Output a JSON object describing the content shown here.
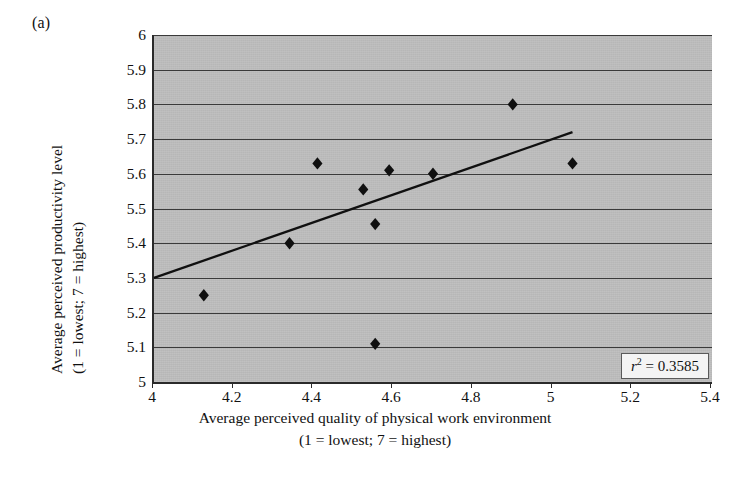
{
  "figure": {
    "panel_label": "(a)"
  },
  "annotation": {
    "r_symbol": "r",
    "r_exponent": "2",
    "r_equals": " = 0.3585",
    "r2_text": "r2 = 0.3585",
    "r2_value": 0.3585
  },
  "axes": {
    "y_title_line1": "Average perceived productivity level",
    "y_title_line2": "(1 = lowest; 7 = highest)",
    "x_title_line1": "Average perceived quality of physical work environment",
    "x_title_line2": "(1 = lowest; 7 = highest)",
    "y_ticks": [
      "5",
      "5.1",
      "5.2",
      "5.3",
      "5.4",
      "5.5",
      "5.6",
      "5.7",
      "5.8",
      "5.9",
      "6"
    ],
    "x_ticks": [
      "4",
      "4.2",
      "4.4",
      "4.6",
      "4.8",
      "5",
      "5.2",
      "5.4"
    ]
  },
  "colors": {
    "plot_background": "#bcbcbc",
    "gridline": "#3a3a3a",
    "axis": "#2a2a2a",
    "marker": "#101010",
    "trendline": "#101010",
    "page_background": "#ffffff"
  },
  "chart_data": {
    "type": "scatter",
    "title": "",
    "xlabel": "Average perceived quality of physical work environment (1 = lowest; 7 = highest)",
    "ylabel": "Average perceived productivity level (1 = lowest; 7 = highest)",
    "xlim": [
      4,
      5.4
    ],
    "ylim": [
      5,
      6
    ],
    "xticks": [
      4,
      4.2,
      4.4,
      4.6,
      4.8,
      5,
      5.2,
      5.4
    ],
    "yticks": [
      5,
      5.1,
      5.2,
      5.3,
      5.4,
      5.5,
      5.6,
      5.7,
      5.8,
      5.9,
      6
    ],
    "grid": "horizontal",
    "legend": "none",
    "marker": "diamond",
    "points": [
      {
        "x": 4.125,
        "y": 5.25
      },
      {
        "x": 4.34,
        "y": 5.4
      },
      {
        "x": 4.41,
        "y": 5.63
      },
      {
        "x": 4.525,
        "y": 5.555
      },
      {
        "x": 4.555,
        "y": 5.455
      },
      {
        "x": 4.555,
        "y": 5.11
      },
      {
        "x": 4.59,
        "y": 5.61
      },
      {
        "x": 4.7,
        "y": 5.6
      },
      {
        "x": 4.9,
        "y": 5.8
      },
      {
        "x": 5.05,
        "y": 5.63
      }
    ],
    "trendline": {
      "x0": 4.0,
      "y0": 5.3,
      "x1": 5.05,
      "y1": 5.72
    },
    "annotations": [
      {
        "text": "r2 = 0.3585",
        "position": "bottom-right"
      }
    ]
  }
}
